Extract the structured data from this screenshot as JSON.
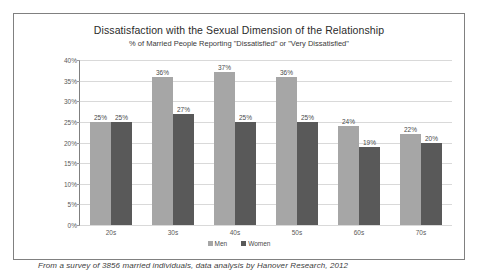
{
  "chart_data": {
    "type": "bar",
    "title": "Dissatisfaction with the Sexual Dimension of the Relationship",
    "subtitle": "% of Married People Reporting \"Dissatisfied\" or \"Very Dissatisfied\"",
    "xlabel": "",
    "ylabel": "",
    "ylim": [
      0,
      40
    ],
    "ytick_labels": [
      "40%",
      "35%",
      "30%",
      "25%",
      "20%",
      "15%",
      "10%",
      "5%",
      "0%"
    ],
    "ytick_values": [
      40,
      35,
      30,
      25,
      20,
      15,
      10,
      5,
      0
    ],
    "grid": true,
    "legend_position": "bottom",
    "categories": [
      "20s",
      "30s",
      "40s",
      "50s",
      "60s",
      "70s"
    ],
    "series": [
      {
        "name": "Men",
        "color": "#a6a6a6",
        "values": [
          25,
          36,
          37,
          36,
          24,
          22
        ],
        "value_labels": [
          "25%",
          "36%",
          "37%",
          "36%",
          "24%",
          "22%"
        ]
      },
      {
        "name": "Women",
        "color": "#595959",
        "values": [
          25,
          27,
          25,
          25,
          19,
          20
        ],
        "value_labels": [
          "25%",
          "27%",
          "25%",
          "25%",
          "19%",
          "20%"
        ]
      }
    ]
  },
  "footer": {
    "note": "From a survey of 3856 married individuals, data analysis by Hanover Research, 2012"
  }
}
